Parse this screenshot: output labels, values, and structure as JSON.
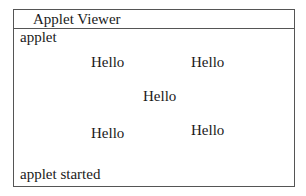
{
  "window": {
    "title": "Applet Viewer",
    "menu_label": "applet",
    "status": "applet started"
  },
  "canvas": {
    "labels": [
      {
        "text": "Hello",
        "x": 90,
        "y": 53
      },
      {
        "text": "Hello",
        "x": 190,
        "y": 53
      },
      {
        "text": "Hello",
        "x": 142,
        "y": 87
      },
      {
        "text": "Hello",
        "x": 90,
        "y": 124
      },
      {
        "text": "Hello",
        "x": 190,
        "y": 121
      }
    ]
  }
}
